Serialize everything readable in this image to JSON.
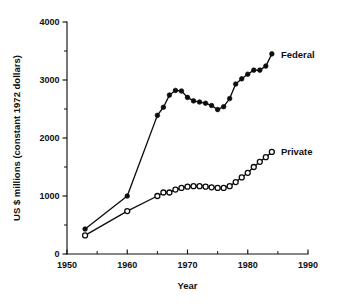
{
  "chart_data": {
    "type": "line",
    "title": "",
    "xlabel": "Year",
    "ylabel": "US $ millions (constant 1972 dollars)",
    "xlim": [
      1950,
      1990
    ],
    "ylim": [
      0,
      4000
    ],
    "grid": false,
    "legend_position": "right-inline",
    "x_ticks": [
      1950,
      1960,
      1970,
      1980,
      1990
    ],
    "x_tick_labels": [
      "1950",
      "1960",
      "1970",
      "1980",
      "1990"
    ],
    "x_minor_ticks": [
      1955,
      1965,
      1975,
      1985
    ],
    "y_ticks": [
      0,
      1000,
      2000,
      3000,
      4000
    ],
    "y_tick_labels": [
      "0",
      "1000",
      "2000",
      "3000",
      "4000"
    ],
    "y_minor_ticks": [
      500,
      1500,
      2500,
      3500
    ],
    "series": [
      {
        "name": "Federal",
        "marker": "filled-circle",
        "x": [
          1953,
          1960,
          1965,
          1966,
          1967,
          1968,
          1969,
          1970,
          1971,
          1972,
          1973,
          1974,
          1975,
          1976,
          1977,
          1978,
          1979,
          1980,
          1981,
          1982,
          1983,
          1984
        ],
        "values": [
          430,
          1000,
          2390,
          2530,
          2740,
          2820,
          2810,
          2700,
          2640,
          2620,
          2600,
          2560,
          2490,
          2540,
          2680,
          2930,
          3020,
          3100,
          3170,
          3170,
          3240,
          3450
        ]
      },
      {
        "name": "Private",
        "marker": "open-circle",
        "x": [
          1953,
          1960,
          1965,
          1966,
          1967,
          1968,
          1969,
          1970,
          1971,
          1972,
          1973,
          1974,
          1975,
          1976,
          1977,
          1978,
          1979,
          1980,
          1981,
          1982,
          1983,
          1984
        ],
        "values": [
          320,
          740,
          1000,
          1060,
          1060,
          1110,
          1140,
          1160,
          1170,
          1170,
          1160,
          1150,
          1140,
          1140,
          1170,
          1240,
          1320,
          1400,
          1500,
          1590,
          1670,
          1760
        ]
      }
    ],
    "annotations": [
      {
        "text": "Federal",
        "x": 1985.5,
        "y": 3440
      },
      {
        "text": "Private",
        "x": 1985.5,
        "y": 1770
      }
    ],
    "colors": {
      "line": "#0d0d0d",
      "text": "#101010",
      "background": "#ffffff"
    }
  }
}
